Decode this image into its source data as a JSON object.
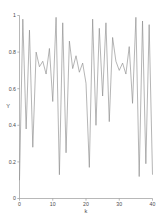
{
  "chart_data": {
    "type": "line",
    "title": "",
    "xlabel": "k",
    "ylabel": "Y",
    "xlim": [
      0,
      40
    ],
    "ylim": [
      0,
      1
    ],
    "grid": false,
    "legend": null,
    "line_color": "#8c8c8c",
    "background_color": "#ffffff",
    "axis_color": "#9a9a9a",
    "xticks": [
      0,
      10,
      20,
      30,
      40
    ],
    "xtick_labels": [
      "0",
      "10",
      "20",
      "30",
      "40"
    ],
    "yticks": [
      0,
      0.2,
      0.4,
      0.6,
      0.8,
      1
    ],
    "ytick_labels": [
      "0",
      "0.2",
      "0.4",
      "0.6",
      "0.8",
      "1"
    ],
    "x": [
      0,
      1,
      2,
      3,
      4,
      5,
      6,
      7,
      8,
      9,
      10,
      11,
      12,
      13,
      14,
      15,
      16,
      17,
      18,
      19,
      20,
      21,
      22,
      23,
      24,
      25,
      26,
      27,
      28,
      29,
      30,
      31,
      32,
      33,
      34,
      35,
      36,
      37,
      38,
      39,
      40
    ],
    "values": [
      0.1,
      0.98,
      0.38,
      0.92,
      0.28,
      0.8,
      0.72,
      0.75,
      0.68,
      0.82,
      0.53,
      0.99,
      0.13,
      0.96,
      0.25,
      0.86,
      0.71,
      0.78,
      0.69,
      0.74,
      0.63,
      0.17,
      0.98,
      0.4,
      0.93,
      0.56,
      0.96,
      0.42,
      0.88,
      0.75,
      0.7,
      0.74,
      0.68,
      0.83,
      0.52,
      0.99,
      0.12,
      0.97,
      0.19,
      0.95,
      0.13
    ],
    "xlabel_anchor": "k",
    "ylabel_anchor": "Y"
  }
}
